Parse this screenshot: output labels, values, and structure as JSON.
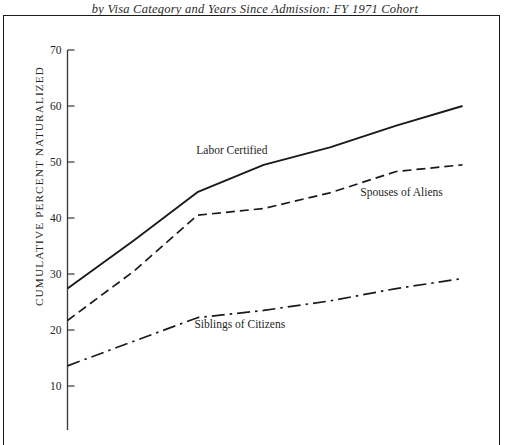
{
  "figure": {
    "title_line_1": "Cumulative Percent Naturalized",
    "title_line_2": "by Visa Category and Years Since Admission: FY 1971 Cohort",
    "ylabel": "CUMULATIVE PERCENT NATURALIZED",
    "frame_color": "#1c1c1c",
    "axis_color": "#3a3a3a",
    "line_color": "#1a1a1a"
  },
  "chart_data": {
    "type": "line",
    "title": "Cumulative Percent Naturalized by Visa Category and Years Since Admission: FY 1971 Cohort",
    "xlabel": "Years Since Admission",
    "ylabel": "CUMULATIVE PERCENT NATURALIZED",
    "ylim": [
      5,
      70
    ],
    "yticks": [
      10,
      20,
      30,
      40,
      50,
      60,
      70
    ],
    "ytick_labels": [
      "10",
      "20",
      "30",
      "40",
      "50",
      "60",
      "70"
    ],
    "xlim": [
      0,
      18
    ],
    "grid": false,
    "legend": "inline-annotations",
    "series": [
      {
        "name": "Labor Certified",
        "style": "solid",
        "label_x": 6.2,
        "label_y": 51.5,
        "x": [
          0,
          2.5,
          4.9,
          7.4,
          9.9,
          12.4,
          14.9
        ],
        "values": [
          27.4,
          36.0,
          44.6,
          49.5,
          52.6,
          56.5,
          60.0
        ]
      },
      {
        "name": "Spouses of Aliens",
        "style": "dashed",
        "label_x": 12.6,
        "label_y": 44.0,
        "x": [
          0,
          2.5,
          4.9,
          7.4,
          9.9,
          12.4,
          14.9
        ],
        "values": [
          21.7,
          30.5,
          40.5,
          41.7,
          44.5,
          48.3,
          49.5
        ]
      },
      {
        "name": "Siblings of Citizens",
        "style": "dash-dot",
        "label_x": 6.5,
        "label_y": 20.3,
        "x": [
          0,
          2.5,
          4.9,
          7.4,
          9.9,
          12.4,
          14.9
        ],
        "values": [
          13.6,
          18.0,
          22.2,
          23.5,
          25.2,
          27.4,
          29.2
        ]
      }
    ]
  }
}
